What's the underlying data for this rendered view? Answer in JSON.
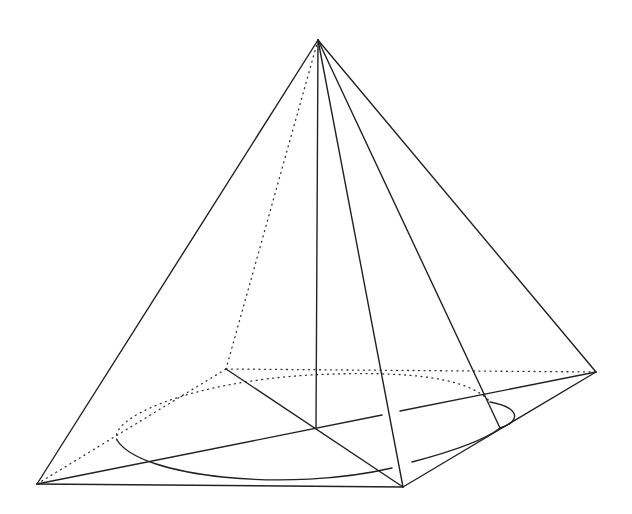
{
  "diagram": {
    "stroke_color": "#222222",
    "background": "#ffffff",
    "vertices": {
      "apex": [
        318,
        40
      ],
      "left": [
        37,
        484
      ],
      "front": [
        403,
        487
      ],
      "right": [
        596,
        372
      ],
      "back": [
        226,
        369
      ],
      "base_center": [
        316,
        428
      ],
      "tangent_point": [
        500,
        428
      ]
    },
    "solid_edges": [
      {
        "name": "apex-left",
        "from": "apex",
        "to": "left"
      },
      {
        "name": "apex-front",
        "from": "apex",
        "to": "front"
      },
      {
        "name": "apex-right",
        "from": "apex",
        "to": "right"
      },
      {
        "name": "apex-center-height",
        "from": "apex",
        "to": "base_center"
      },
      {
        "name": "apex-tangent",
        "from": "apex",
        "to": "tangent_point"
      },
      {
        "name": "left-front",
        "from": "left",
        "to": "front"
      },
      {
        "name": "front-right",
        "from": "front",
        "to": "right"
      },
      {
        "name": "back-front-diagonal",
        "from": "back",
        "to": "front"
      },
      {
        "name": "left-right-diagonal",
        "from": "left",
        "to": "right"
      }
    ],
    "dotted_edges": [
      {
        "name": "apex-back",
        "from": "apex",
        "to": "back"
      },
      {
        "name": "left-back",
        "from": "left",
        "to": "back"
      },
      {
        "name": "back-right",
        "from": "back",
        "to": "right"
      }
    ],
    "ellipse": {
      "visible_path": "M 117 438 C 135 478, 300 490, 390 470 M 405 462 C 450 450, 500 440, 505 428 M 490 402 C 520 410, 520 420, 505 428",
      "hidden_path": "M 117 438 C 110 420, 180 385, 300 375 C 400 370, 470 378, 490 402"
    }
  }
}
